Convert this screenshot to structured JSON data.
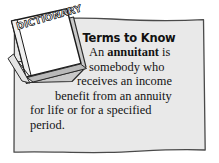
{
  "callout": {
    "heading": "Terms to Know",
    "term": "annuitant",
    "body_lines": [
      "An annuitant is",
      "somebody who",
      "receives an income",
      "benefit from an annuity",
      "for life or for a specified",
      "period."
    ],
    "body_full": "An annuitant is somebody who receives an income benefit from an annuity for life or for a specified period.",
    "line1_before": "An ",
    "line1_after": " is",
    "line2": "somebody who",
    "line3": "receives an income",
    "line4": "benefit from an annuity",
    "line5": "for life or for a specified",
    "line6": "period."
  },
  "graphic": {
    "book_label": "DICTIONARY",
    "icon_name": "dictionary-book-icon"
  },
  "colors": {
    "box_fill": "#e9e9e9",
    "box_border": "#4a4a4a",
    "page_background": "#ffffff",
    "text": "#131313",
    "book_cover": "#ffffff",
    "book_outline": "#1a1a1a",
    "book_pages": "#d8d8d8"
  }
}
